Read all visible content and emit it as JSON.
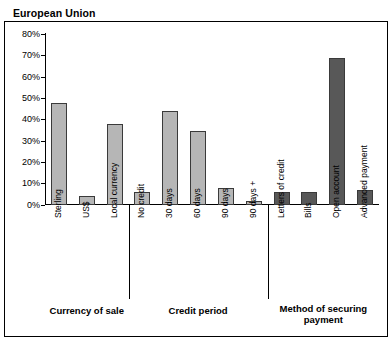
{
  "title": "European Union",
  "chart_data": {
    "type": "bar",
    "title": "European Union",
    "xlabel": "",
    "ylabel": "",
    "ylim": [
      0,
      80
    ],
    "ytick_labels": [
      "80%",
      "70%",
      "60%",
      "50%",
      "40%",
      "30%",
      "20%",
      "10%",
      "0%"
    ],
    "ytick_values": [
      80,
      70,
      60,
      50,
      40,
      30,
      20,
      10,
      0
    ],
    "grid": false,
    "legend": "none",
    "categories": [
      "Sterling",
      "US$",
      "Local currency",
      "No credit",
      "30 days",
      "60 days",
      "90 days",
      "90 days +",
      "Letters of credit",
      "Bills",
      "Open account",
      "Advanced payment"
    ],
    "values": [
      48,
      4,
      38,
      6,
      44,
      35,
      8,
      2,
      6,
      6,
      69,
      7
    ],
    "groups": [
      {
        "label": "Currency of sale",
        "categories": [
          "Sterling",
          "US$",
          "Local currency"
        ]
      },
      {
        "label": "Credit period",
        "categories": [
          "No credit",
          "30 days",
          "60 days",
          "90 days",
          "90 days +"
        ]
      },
      {
        "label": "Method of securing payment",
        "categories": [
          "Letters of credit",
          "Bills",
          "Open account",
          "Advanced payment"
        ]
      }
    ],
    "bar_colors": [
      "#b6b6b6",
      "#b6b6b6",
      "#b6b6b6",
      "#b6b6b6",
      "#b6b6b6",
      "#b6b6b6",
      "#b6b6b6",
      "#b6b6b6",
      "#585858",
      "#585858",
      "#585858",
      "#585858"
    ],
    "accent_light": "#b6b6b6",
    "accent_dark": "#585858"
  },
  "group_labels": {
    "currency": "Currency of sale",
    "credit": "Credit period",
    "method_line1": "Method of securing",
    "method_line2": "payment"
  }
}
